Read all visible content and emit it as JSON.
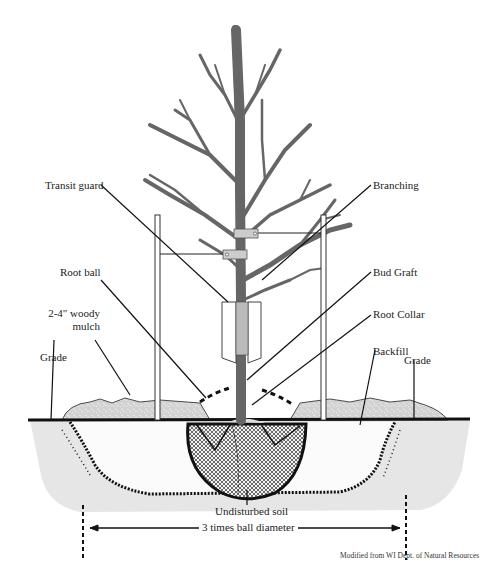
{
  "diagram": {
    "labels": {
      "transit_guard": "Transit guard",
      "branching": "Branching",
      "root_ball": "Root ball",
      "bud_graft": "Bud Graft",
      "mulch_line1": "2-4\" woody",
      "mulch_line2": "mulch",
      "root_collar": "Root Collar",
      "grade_left": "Grade",
      "backfill": "Backfill",
      "grade_right": "Grade",
      "undisturbed_soil": "Undisturbed soil",
      "dimension": "3 times ball diameter"
    },
    "credit": "Modified from WI Dept. of Natural Resources",
    "colors": {
      "tree": "#666666",
      "ink": "#111111",
      "soil_shade": "#e4e4e4",
      "mulch": "#cfcfcf",
      "guard": "#bdbdbd"
    }
  }
}
